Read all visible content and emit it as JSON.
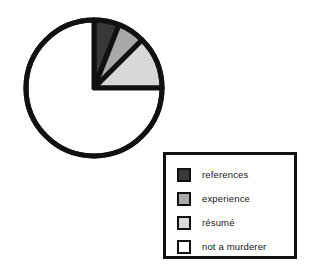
{
  "chart_data": {
    "type": "pie",
    "title": "",
    "categories": [
      "references",
      "experience",
      "résumé",
      "not a murderer"
    ],
    "values": [
      6,
      6.5,
      12.5,
      75
    ],
    "units": "percent",
    "start_angle_deg": 0,
    "direction": "clockwise",
    "colors": [
      "#383838",
      "#a8a8a8",
      "#d8d8d8",
      "#ffffff"
    ],
    "slice_angles_deg": [
      21.6,
      23.4,
      45.0,
      270.0
    ],
    "legend": {
      "position": "bottom-right",
      "entries": [
        {
          "label": "references",
          "color": "#383838"
        },
        {
          "label": "experience",
          "color": "#a8a8a8"
        },
        {
          "label": "résumé",
          "color": "#d8d8d8"
        },
        {
          "label": "not a murderer",
          "color": "#ffffff"
        }
      ]
    },
    "grid": false,
    "xlabel": "",
    "ylabel": ""
  },
  "style": {
    "outline_color": "#111111",
    "background": "#ffffff"
  }
}
